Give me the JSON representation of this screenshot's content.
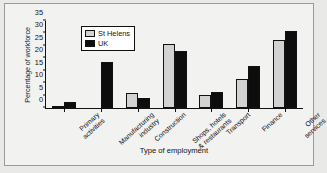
{
  "chart_data": {
    "type": "bar",
    "title": "",
    "xlabel": "Type of employment",
    "ylabel": "Percentage of workforce",
    "ylim": [
      0,
      35
    ],
    "yticks": [
      0,
      5,
      10,
      15,
      20,
      25,
      30,
      35
    ],
    "grid": false,
    "legend_position": "top-left",
    "categories": [
      "Primary activities",
      "Manufacturing industry",
      "Construction",
      "Shops, hotels & restaurants",
      "Transport",
      "Finance",
      "Other services"
    ],
    "series": [
      {
        "name": "St Helens",
        "color": "#d2d2d2",
        "values": [
          0.3,
          0,
          6.0,
          25.8,
          5.4,
          11.5,
          27.5
        ]
      },
      {
        "name": "UK",
        "color": "#0d0d0d",
        "values": [
          2.5,
          18.5,
          4.0,
          23.0,
          6.5,
          17.0,
          31.0
        ]
      }
    ]
  },
  "figure": {
    "background_color": "#f2f2f0",
    "border_color": "#9a9a98",
    "axis_color": "#111111"
  }
}
